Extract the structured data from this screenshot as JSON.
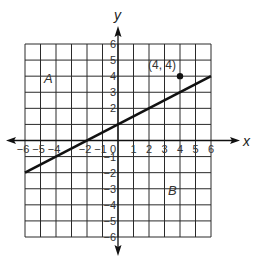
{
  "chart_data": {
    "type": "line",
    "title": "",
    "xlabel": "x",
    "ylabel": "y",
    "xlim": [
      -6,
      6
    ],
    "ylim": [
      -6,
      6
    ],
    "grid": true,
    "x_ticks": [
      -6,
      -5,
      -4,
      -3,
      -2,
      -1,
      1,
      2,
      3,
      4,
      5,
      6
    ],
    "x_tick_labels": [
      "−6",
      "−5",
      "−4",
      "",
      "−2",
      "−1",
      "1",
      "2",
      "3",
      "4",
      "5",
      "6"
    ],
    "y_ticks": [
      6,
      5,
      4,
      3,
      2,
      1,
      -1,
      -2,
      -3,
      -4,
      -5,
      -6
    ],
    "y_tick_labels": [
      "6",
      "5",
      "4",
      "3",
      "2",
      "",
      "−1",
      "−2",
      "−3",
      "−4",
      "−5",
      "−6"
    ],
    "origin_label": "0",
    "series": [
      {
        "name": "line",
        "slope": 0.5,
        "intercept": 1,
        "x": [
          -6,
          6
        ],
        "y": [
          -2,
          4
        ]
      }
    ],
    "points": [
      {
        "x": 4,
        "y": 4,
        "label": "(4, 4)"
      }
    ],
    "annotations": [
      {
        "text": "A",
        "x": -4.5,
        "y": 3.6
      },
      {
        "text": "B",
        "x": 3.5,
        "y": -3.4
      }
    ]
  }
}
